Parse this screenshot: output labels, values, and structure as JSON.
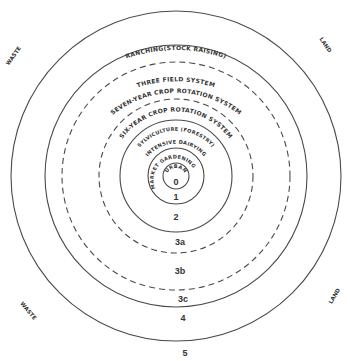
{
  "diagram": {
    "center": {
      "x": 176,
      "y": 176
    },
    "rings": [
      {
        "r": 165,
        "style": "solid"
      },
      {
        "r": 131,
        "style": "solid"
      },
      {
        "r": 114,
        "style": "dashed"
      },
      {
        "r": 77,
        "style": "dashed"
      },
      {
        "r": 56,
        "style": "solid"
      },
      {
        "r": 28,
        "style": "solid"
      },
      {
        "r": 13,
        "style": "solid"
      }
    ],
    "arc_labels": {
      "ranching": "RANCHING(STOCK RAISING)",
      "three_field": "THREE FIELD SYSTEM",
      "seven_year": "SEVEN-YEAR CROP ROTATION SYSTEM",
      "six_year": "SIX-YEAR CROP ROTATION SYSTEM",
      "sylviculture": "SYLVICULTURE (FORESTRY)",
      "intensive_dairying": "INTENSIVE DAIRYING",
      "market_gardening": "MARKET GARDENING",
      "urban": "URBAN"
    },
    "zone_numbers": {
      "z0": "0",
      "z1": "1",
      "z2": "2",
      "z3a": "3a",
      "z3b": "3b",
      "z3c": "3c",
      "z4": "4",
      "z5": "5"
    },
    "corner_labels": {
      "top_left": "WASTE",
      "top_right": "LAND",
      "bottom_left": "WASTE",
      "bottom_right": "LAND"
    }
  }
}
